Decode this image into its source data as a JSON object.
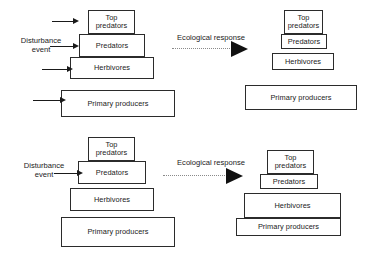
{
  "figure": {
    "type": "ecological-pyramid-diagram",
    "panel_count": 2,
    "trophic_labels": {
      "top_predators": "Top\npredators",
      "predators": "Predators",
      "herbivores": "Herbivores",
      "primary_producers": "Primary producers"
    }
  },
  "panels": [
    {
      "id": "panel-top",
      "disturbance_label": "Disturbance\nevent",
      "response_label": "Ecological response",
      "before": {
        "name": "before-pyramid",
        "tiers": [
          {
            "key": "top_predators",
            "label": "Top\npredators"
          },
          {
            "key": "predators",
            "label": "Predators"
          },
          {
            "key": "herbivores",
            "label": "Herbivores"
          },
          {
            "key": "primary_producers",
            "label": "Primary producers"
          }
        ]
      },
      "after": {
        "name": "after-pyramid",
        "tiers": [
          {
            "key": "top_predators",
            "label": "Top\npredators"
          },
          {
            "key": "predators",
            "label": "Predators"
          },
          {
            "key": "herbivores",
            "label": "Herbivores"
          },
          {
            "key": "primary_producers",
            "label": "Primary producers"
          }
        ]
      },
      "disturbance_arrow_count": 4
    },
    {
      "id": "panel-bottom",
      "disturbance_label": "Disturbance\nevent",
      "response_label": "Ecological response",
      "before": {
        "name": "before-pyramid",
        "tiers": [
          {
            "key": "top_predators",
            "label": "Top\npredators"
          },
          {
            "key": "predators",
            "label": "Predators"
          },
          {
            "key": "herbivores",
            "label": "Herbivores"
          },
          {
            "key": "primary_producers",
            "label": "Primary producers"
          }
        ]
      },
      "after": {
        "name": "after-pyramid",
        "tiers": [
          {
            "key": "top_predators",
            "label": "Top\npredators"
          },
          {
            "key": "predators",
            "label": "Predators"
          },
          {
            "key": "herbivores",
            "label": "Herbivores"
          },
          {
            "key": "primary_producers",
            "label": "Primary producers"
          }
        ]
      },
      "disturbance_arrow_count": 1
    }
  ],
  "colors": {
    "box_stroke": "#2b2b2b",
    "box_fill": "#ffffff",
    "text": "#1a1a1a",
    "arrow_solid": "#111111",
    "arrow_dotted": "#8a8a8a",
    "background": "#ffffff"
  }
}
